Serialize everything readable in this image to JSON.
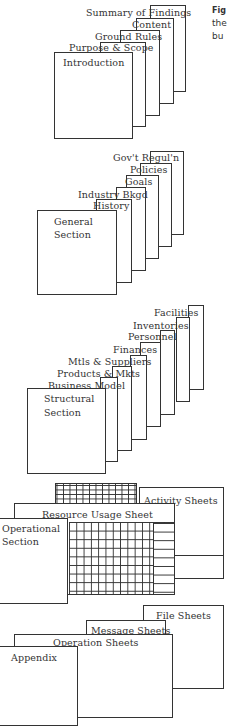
{
  "caption": {
    "line1": "Fig",
    "line2": "the",
    "line3": "bu"
  },
  "groups": [
    {
      "name": "introduction",
      "front_label": "Introduction",
      "tabs": [
        "Purpose & Scope",
        "Ground Rules",
        "Content",
        "Summary of Findings"
      ]
    },
    {
      "name": "general",
      "front_label_line1": "General",
      "front_label_line2": "Section",
      "tabs": [
        "History",
        "Industry Bkgd",
        "Goals",
        "Policies",
        "Gov't Regul'n"
      ]
    },
    {
      "name": "structural",
      "front_label_line1": "Structural",
      "front_label_line2": "Section",
      "tabs": [
        "Business Model",
        "Products & Mkts",
        "Mtls & Suppliers",
        "Finances",
        "Personnel",
        "Inventories",
        "Facilities"
      ]
    },
    {
      "name": "operational",
      "front_label_line1": "Operational",
      "front_label_line2": "Section",
      "sheets": [
        "Resource Usage Sheet",
        "Activity Sheets"
      ]
    },
    {
      "name": "appendix",
      "front_label": "Appendix",
      "sheets": [
        "Operation Sheets",
        "Message Sheets",
        "File Sheets"
      ]
    }
  ]
}
